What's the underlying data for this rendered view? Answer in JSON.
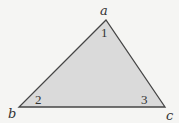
{
  "diagram": {
    "type": "triangle",
    "colors": {
      "background": "#f5f5f3",
      "fill": "#dadada",
      "stroke": "#454545"
    },
    "vertices": [
      {
        "id": "a",
        "label": "a",
        "x": 106,
        "y": 20
      },
      {
        "id": "b",
        "label": "b",
        "x": 19,
        "y": 107
      },
      {
        "id": "c",
        "label": "c",
        "x": 165,
        "y": 107
      }
    ],
    "angles": [
      {
        "vertex": "a",
        "label": "1"
      },
      {
        "vertex": "b",
        "label": "2"
      },
      {
        "vertex": "c",
        "label": "3"
      }
    ]
  }
}
